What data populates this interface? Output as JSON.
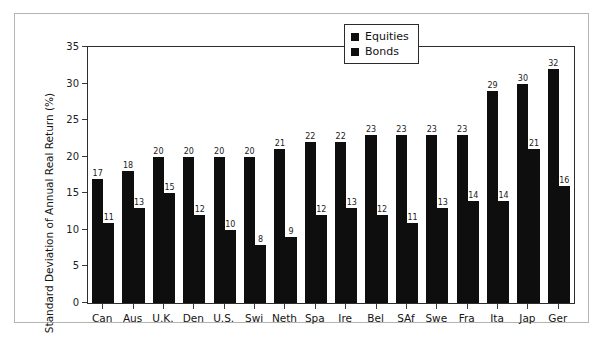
{
  "chart_data": {
    "type": "bar",
    "title": "",
    "xlabel": "",
    "ylabel": "Standard Deviation of Annual Real Return (%)",
    "ylim": [
      0,
      35
    ],
    "yticks": [
      0,
      5,
      10,
      15,
      20,
      25,
      30,
      35
    ],
    "grid": false,
    "legend_position": "top-right",
    "categories": [
      "Can",
      "Aus",
      "U.K.",
      "Den",
      "U.S.",
      "Swi",
      "Neth",
      "Spa",
      "Ire",
      "Bel",
      "SAf",
      "Swe",
      "Fra",
      "Ita",
      "Jap",
      "Ger"
    ],
    "series": [
      {
        "name": "Equities",
        "color": "#0e0e0e",
        "values": [
          17,
          18,
          20,
          20,
          20,
          20,
          21,
          22,
          22,
          23,
          23,
          23,
          23,
          29,
          30,
          32
        ]
      },
      {
        "name": "Bonds",
        "color": "#0e0e0e",
        "values": [
          11,
          13,
          15,
          12,
          10,
          8,
          9,
          12,
          13,
          12,
          11,
          13,
          14,
          14,
          21,
          16
        ]
      }
    ]
  },
  "legend": {
    "items": [
      {
        "label": "Equities"
      },
      {
        "label": "Bonds"
      }
    ]
  },
  "axis": {
    "y_label": "Standard Deviation of Annual Real Return (%)",
    "y_ticks": [
      "0",
      "5",
      "10",
      "15",
      "20",
      "25",
      "30",
      "35"
    ]
  },
  "colors": {
    "bar": "#0e0e0e",
    "axis": "#2d2d2d",
    "frame": "#b4b4b0",
    "background": "#ffffff",
    "page": "#b9b9b5"
  }
}
